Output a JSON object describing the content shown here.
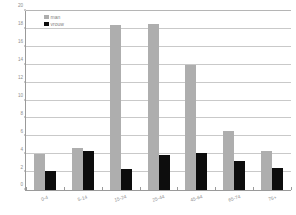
{
  "chart_data": {
    "type": "bar",
    "title": "",
    "xlabel": "",
    "ylabel": "",
    "categories": [
      "0-4",
      "5-14",
      "15-24",
      "25-44",
      "45-64",
      "65-74",
      "75+"
    ],
    "series": [
      {
        "name": "man",
        "color": "#aeaeae",
        "values": [
          4.0,
          4.7,
          18.4,
          18.6,
          14.0,
          6.6,
          4.4
        ]
      },
      {
        "name": "vrouw",
        "color": "#0d0d0d",
        "values": [
          2.1,
          4.4,
          2.4,
          3.9,
          4.1,
          3.2,
          2.5
        ]
      }
    ],
    "ylim": [
      0,
      20
    ],
    "ytick_step": 2,
    "yticks": [
      "0",
      "2",
      "4",
      "6",
      "8",
      "10",
      "12",
      "14",
      "16",
      "18",
      "20"
    ],
    "grid": true,
    "legend_position": "top-left"
  },
  "legend": {
    "items": [
      {
        "label": "man"
      },
      {
        "label": "vrouw"
      }
    ]
  }
}
